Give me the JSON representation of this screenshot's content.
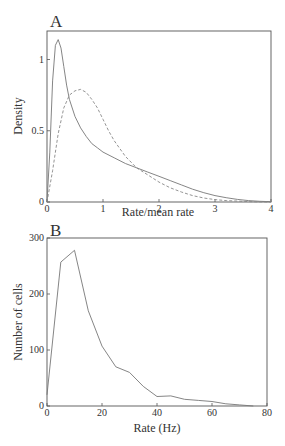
{
  "figure": {
    "clipped_header_note": "",
    "colors": {
      "axis": "#555555",
      "line": "#777777",
      "text": "#333333",
      "background": "#ffffff"
    }
  },
  "chart_data": [
    {
      "panel": "A",
      "type": "line",
      "title": "",
      "xlabel": "Rate/mean rate",
      "ylabel": "Density",
      "xlim": [
        0,
        4
      ],
      "ylim": [
        0,
        1.2
      ],
      "xticks": [
        0,
        1,
        2,
        3,
        4
      ],
      "yticks": [
        0,
        0.5,
        1
      ],
      "ytick_labels": [
        "0",
        "0.5",
        "1"
      ],
      "grid": false,
      "legend": null,
      "series": [
        {
          "name": "solid",
          "style": "solid",
          "x": [
            0,
            0.05,
            0.1,
            0.15,
            0.2,
            0.25,
            0.3,
            0.35,
            0.4,
            0.5,
            0.6,
            0.7,
            0.8,
            0.9,
            1.0,
            1.2,
            1.4,
            1.6,
            1.8,
            2.0,
            2.2,
            2.4,
            2.6,
            2.8,
            3.0,
            3.2,
            3.4,
            3.6,
            3.8,
            4.0
          ],
          "y": [
            0,
            0.35,
            0.85,
            1.1,
            1.14,
            1.08,
            0.95,
            0.82,
            0.72,
            0.6,
            0.52,
            0.46,
            0.41,
            0.38,
            0.35,
            0.31,
            0.27,
            0.24,
            0.21,
            0.18,
            0.15,
            0.12,
            0.09,
            0.065,
            0.045,
            0.03,
            0.018,
            0.01,
            0.005,
            0.002
          ]
        },
        {
          "name": "dashed",
          "style": "dashed",
          "x": [
            0,
            0.1,
            0.2,
            0.3,
            0.4,
            0.5,
            0.6,
            0.7,
            0.8,
            0.9,
            1.0,
            1.1,
            1.2,
            1.4,
            1.6,
            1.8,
            2.0,
            2.2,
            2.4,
            2.6,
            2.8,
            3.0,
            3.2,
            3.4,
            3.6,
            3.8,
            4.0
          ],
          "y": [
            0,
            0.22,
            0.48,
            0.66,
            0.75,
            0.78,
            0.79,
            0.77,
            0.72,
            0.66,
            0.58,
            0.5,
            0.43,
            0.32,
            0.24,
            0.19,
            0.14,
            0.1,
            0.07,
            0.045,
            0.028,
            0.017,
            0.01,
            0.006,
            0.003,
            0.001,
            0.0
          ]
        }
      ]
    },
    {
      "panel": "B",
      "type": "line",
      "title": "",
      "xlabel": "Rate (Hz)",
      "ylabel": "Number of cells",
      "xlim": [
        0,
        80
      ],
      "ylim": [
        0,
        300
      ],
      "xticks": [
        0,
        20,
        40,
        60,
        80
      ],
      "yticks": [
        0,
        100,
        200,
        300
      ],
      "grid": false,
      "legend": null,
      "series": [
        {
          "name": "cells",
          "style": "solid",
          "x": [
            0,
            5,
            10,
            15,
            20,
            25,
            30,
            35,
            40,
            45,
            50,
            55,
            60,
            65,
            70,
            75
          ],
          "y": [
            20,
            257,
            278,
            170,
            107,
            70,
            60,
            35,
            17,
            18,
            12,
            10,
            8,
            4,
            2,
            0
          ]
        }
      ]
    }
  ]
}
